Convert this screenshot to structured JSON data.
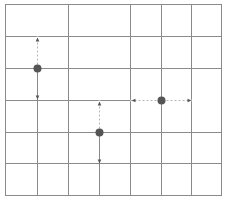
{
  "diagram": {
    "width": 228,
    "height": 204,
    "colors": {
      "background": "#ffffff",
      "grid": "#8a8a8a",
      "border": "#8a8a8a",
      "dashed": "#b5b5b5",
      "point": "#555555",
      "arrow": "#555555"
    },
    "border": {
      "x0": 5,
      "y0": 4,
      "x1": 221,
      "y1": 195
    },
    "grid_h_lines": [
      {
        "y": 36,
        "x0": 5,
        "x1": 221
      },
      {
        "y": 68,
        "x0": 5,
        "x1": 221
      },
      {
        "y": 100,
        "x0": 5,
        "x1": 130
      },
      {
        "y": 132,
        "x0": 5,
        "x1": 221
      },
      {
        "y": 163,
        "x0": 5,
        "x1": 221
      }
    ],
    "grid_v_lines": [
      {
        "x": 68,
        "y0": 4,
        "y1": 195
      },
      {
        "x": 130,
        "y0": 4,
        "y1": 195
      },
      {
        "x": 161,
        "y0": 4,
        "y1": 195
      },
      {
        "x": 191,
        "y0": 4,
        "y1": 195
      },
      {
        "x": 37,
        "y0": 68,
        "y1": 195
      },
      {
        "x": 99,
        "y0": 132,
        "y1": 195
      },
      {
        "x": 191,
        "y0": 100,
        "y1": 100
      }
    ],
    "points": [
      {
        "id": "point-1",
        "x": 37,
        "y": 68,
        "r": 4,
        "dashed": [
          {
            "x0": 37,
            "y0": 68,
            "x1": 37,
            "y1": 36
          }
        ],
        "arrows": [
          {
            "x": 37,
            "y": 40,
            "dir": "up"
          },
          {
            "x": 37,
            "y": 96,
            "dir": "down"
          }
        ]
      },
      {
        "id": "point-2",
        "x": 99,
        "y": 132,
        "r": 4,
        "dashed": [
          {
            "x0": 99,
            "y0": 132,
            "x1": 99,
            "y1": 100
          }
        ],
        "arrows": [
          {
            "x": 99,
            "y": 104,
            "dir": "up"
          },
          {
            "x": 99,
            "y": 160,
            "dir": "down"
          }
        ]
      },
      {
        "id": "point-3",
        "x": 161,
        "y": 100,
        "r": 4,
        "dashed": [
          {
            "x0": 130,
            "y0": 100,
            "x1": 191,
            "y1": 100
          }
        ],
        "arrows": [
          {
            "x": 134,
            "y": 100,
            "dir": "left"
          },
          {
            "x": 188,
            "y": 100,
            "dir": "right"
          }
        ]
      }
    ]
  }
}
